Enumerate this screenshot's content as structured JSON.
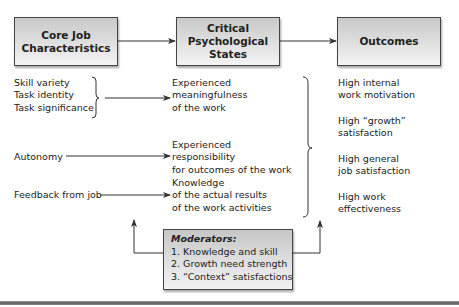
{
  "diagram": {
    "boxes": {
      "core": {
        "title": "Core Job\nCharacteristics"
      },
      "critical": {
        "title": "Critical\nPsychological\nStates"
      },
      "outcomes": {
        "title": "Outcomes"
      }
    },
    "core_characteristics": {
      "group1": [
        "Skill variety",
        "Task identity",
        "Task significance"
      ],
      "autonomy": "Autonomy",
      "feedback": "Feedback from job"
    },
    "psychological_states": [
      {
        "lines": [
          "Experienced",
          "meaningfulness",
          "of the work"
        ]
      },
      {
        "lines": [
          "Experienced",
          "responsibility",
          "for outcomes of the work"
        ]
      },
      {
        "lines": [
          "Knowledge",
          "of the actual results",
          "of the work activities"
        ]
      }
    ],
    "outcomes": [
      {
        "lines": [
          "High internal",
          "work motivation"
        ]
      },
      {
        "lines": [
          "High “growth”",
          "satisfaction"
        ]
      },
      {
        "lines": [
          "High general",
          "job satisfaction"
        ]
      },
      {
        "lines": [
          "High work",
          "effectiveness"
        ]
      }
    ],
    "moderators": {
      "title": "Moderators:",
      "items": [
        "1. Knowledge and skill",
        "2. Growth need strength",
        "3. “Context” satisfactions"
      ]
    },
    "colors": {
      "box_fill_top": "#c9c9c9",
      "box_fill_bottom": "#f4f4f4",
      "line": "#333333",
      "text": "#222222"
    }
  }
}
